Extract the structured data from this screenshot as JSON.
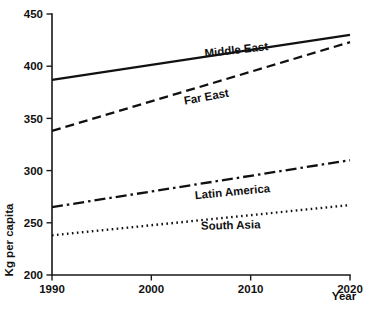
{
  "chart_data": {
    "type": "line",
    "title": "",
    "xlabel": "Year",
    "ylabel": "Kg per capita",
    "xlim": [
      1990,
      2020
    ],
    "ylim": [
      200,
      450
    ],
    "grid": false,
    "legend_position": "inline-labels",
    "x": [
      1990,
      2020
    ],
    "xticks": [
      "1990",
      "2000",
      "2010",
      "2020"
    ],
    "xtick_values": [
      1990,
      2000,
      2010,
      2020
    ],
    "yticks": [
      "200",
      "250",
      "300",
      "350",
      "400",
      "450"
    ],
    "ytick_values": [
      200,
      250,
      300,
      350,
      400,
      450
    ],
    "series": [
      {
        "name": "Middle East",
        "values": [
          387,
          430
        ],
        "style": "solid",
        "label_x": 2008.6,
        "label_y": 412,
        "label_rotation": -6.5
      },
      {
        "name": "Far East",
        "values": [
          338,
          423
        ],
        "style": "dashed",
        "label_x": 2005.6,
        "label_y": 367,
        "label_rotation": -10.5
      },
      {
        "name": "Latin America",
        "values": [
          265,
          310
        ],
        "style": "dashdot",
        "label_x": 2008.2,
        "label_y": 276,
        "label_rotation": -5.5
      },
      {
        "name": "South Asia",
        "values": [
          238,
          267
        ],
        "style": "dotted",
        "label_x": 2008.0,
        "label_y": 244,
        "label_rotation": -1.5
      }
    ]
  },
  "colors": {
    "ink": "#111111",
    "background": "#ffffff"
  }
}
